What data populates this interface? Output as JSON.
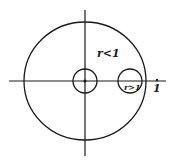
{
  "diagram": {
    "labels": {
      "inner_region": "r<1",
      "right_circle": "r>1",
      "axis_mark": "1"
    },
    "colors": {
      "stroke": "#1a1a1a",
      "background": "#ffffff"
    }
  }
}
